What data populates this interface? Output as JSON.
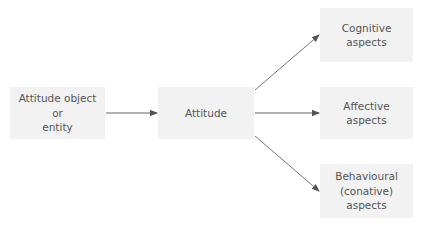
{
  "diagram": {
    "nodes": {
      "object": {
        "lines": [
          "Attitude object",
          "or",
          "entity"
        ]
      },
      "attitude": {
        "lines": [
          "Attitude"
        ]
      },
      "cognitive": {
        "lines": [
          "Cognitive",
          "aspects"
        ]
      },
      "affective": {
        "lines": [
          "Affective",
          "aspects"
        ]
      },
      "behavioural": {
        "lines": [
          "Behavioural",
          "(conative)",
          "aspects"
        ]
      }
    },
    "edges": [
      {
        "from": "object",
        "to": "attitude"
      },
      {
        "from": "attitude",
        "to": "cognitive"
      },
      {
        "from": "attitude",
        "to": "affective"
      },
      {
        "from": "attitude",
        "to": "behavioural"
      }
    ],
    "colors": {
      "box_fill": "#f2f2f2",
      "text": "#555555",
      "arrow": "#555555"
    }
  }
}
